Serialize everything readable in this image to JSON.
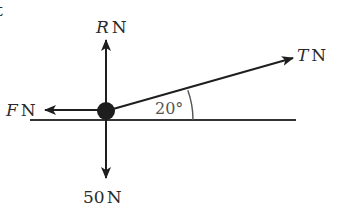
{
  "diagram": {
    "type": "force-diagram",
    "particle": {
      "cx": 106,
      "cy": 111,
      "r": 9,
      "color": "#1e1e1e"
    },
    "surface": {
      "x1": 30,
      "x2": 296,
      "y": 120,
      "color": "#333333"
    },
    "forces": [
      {
        "id": "R",
        "symbol": "R",
        "unit": "N",
        "direction": "up",
        "tip": [
          106,
          40
        ]
      },
      {
        "id": "F",
        "symbol": "F",
        "unit": "N",
        "direction": "left",
        "tip": [
          45,
          110
        ]
      },
      {
        "id": "T",
        "symbol": "T",
        "unit": "N",
        "direction": "up-right",
        "angle_deg": 20,
        "tip": [
          293,
          58
        ]
      },
      {
        "id": "W",
        "symbol": "50",
        "unit": "N",
        "direction": "down",
        "tip": [
          106,
          178
        ]
      }
    ],
    "angle": {
      "label": "20°",
      "value_deg": 20,
      "between": [
        "T",
        "surface"
      ]
    },
    "labels": {
      "R_symbol": "R",
      "R_unit": "N",
      "F_symbol": "F",
      "F_unit": "N",
      "T_symbol": "T",
      "T_unit": "N",
      "weight": "50",
      "weight_unit": "N",
      "angle": "20°",
      "cutoff_fragment": "t"
    }
  }
}
